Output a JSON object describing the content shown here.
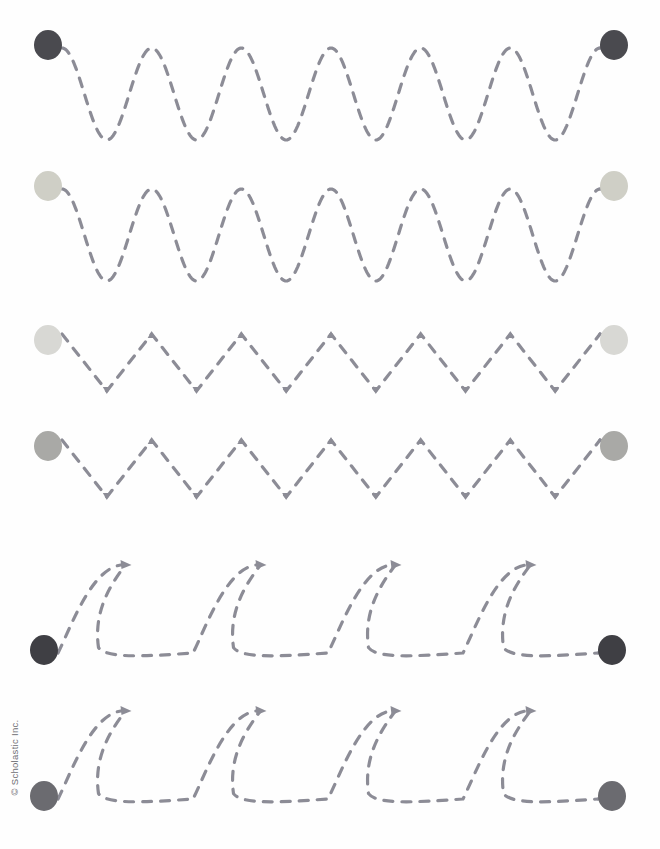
{
  "page": {
    "width": 660,
    "height": 849,
    "background_color": "#fefefe",
    "copyright": "© Scholastic Inc."
  },
  "style": {
    "stroke_color": "#8c8c96",
    "stroke_width": 3.2,
    "dash_pattern": "9 9",
    "dot_radius_x": 14,
    "dot_radius_y": 15
  },
  "rows": [
    {
      "id": "row-1",
      "pattern_name": "sine-wave",
      "pattern_label": "Wave",
      "cycles": 6,
      "start_dot": {
        "cx": 48,
        "cy": 45,
        "color": "#4a4a4f",
        "label": "start-dot"
      },
      "end_dot": {
        "cx": 614,
        "cy": 45,
        "color": "#4a4a4f",
        "label": "end-dot"
      },
      "geometry": {
        "x_start": 62,
        "x_end": 600,
        "y_top": 48,
        "y_bottom": 140,
        "baseline": 94
      }
    },
    {
      "id": "row-2",
      "pattern_name": "sine-wave",
      "pattern_label": "Wave",
      "cycles": 6,
      "start_dot": {
        "cx": 48,
        "cy": 186,
        "color": "#cfcfc6",
        "label": "start-dot"
      },
      "end_dot": {
        "cx": 614,
        "cy": 186,
        "color": "#cfcfc6",
        "label": "end-dot"
      },
      "geometry": {
        "x_start": 62,
        "x_end": 600,
        "y_top": 189,
        "y_bottom": 281,
        "baseline": 235
      }
    },
    {
      "id": "row-3",
      "pattern_name": "zigzag",
      "pattern_label": "Zigzag",
      "cycles": 6,
      "start_dot": {
        "cx": 48,
        "cy": 340,
        "color": "#d8d8d4",
        "label": "start-dot"
      },
      "end_dot": {
        "cx": 614,
        "cy": 340,
        "color": "#d8d8d4",
        "label": "end-dot"
      },
      "geometry": {
        "x_start": 62,
        "x_end": 600,
        "y_top": 334,
        "y_bottom": 391
      }
    },
    {
      "id": "row-4",
      "pattern_name": "zigzag",
      "pattern_label": "Zigzag",
      "cycles": 6,
      "start_dot": {
        "cx": 48,
        "cy": 446,
        "color": "#a9a9a6",
        "label": "start-dot"
      },
      "end_dot": {
        "cx": 614,
        "cy": 446,
        "color": "#a9a9a6",
        "label": "end-dot"
      },
      "geometry": {
        "x_start": 62,
        "x_end": 600,
        "y_top": 440,
        "y_bottom": 497
      }
    },
    {
      "id": "row-5",
      "pattern_name": "cursive-loop",
      "pattern_label": "Loop",
      "cycles": 4,
      "start_dot": {
        "cx": 44,
        "cy": 650,
        "color": "#3f3f44",
        "label": "start-dot"
      },
      "end_dot": {
        "cx": 612,
        "cy": 650,
        "color": "#3f3f44",
        "label": "end-dot"
      },
      "geometry": {
        "x_start": 58,
        "x_end": 598,
        "y_top": 563,
        "y_bottom": 653
      }
    },
    {
      "id": "row-6",
      "pattern_name": "cursive-loop",
      "pattern_label": "Loop",
      "cycles": 4,
      "start_dot": {
        "cx": 44,
        "cy": 796,
        "color": "#6b6b70",
        "label": "start-dot"
      },
      "end_dot": {
        "cx": 612,
        "cy": 796,
        "color": "#6b6b70",
        "label": "end-dot"
      },
      "geometry": {
        "x_start": 58,
        "x_end": 598,
        "y_top": 709,
        "y_bottom": 799
      }
    }
  ]
}
